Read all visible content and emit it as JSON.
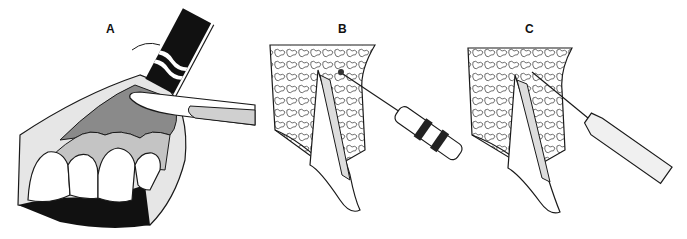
{
  "figure": {
    "panels": [
      {
        "id": "A",
        "label": "A",
        "description": "Anterior teeth with gingiva, local anesthetic injection with syringe needle cap and instrument at mucobuccal fold"
      },
      {
        "id": "B",
        "label": "B",
        "description": "Cross-section of tooth in cancellous bone, needle with syringe inserted into bone near apex"
      },
      {
        "id": "C",
        "label": "C",
        "description": "Cross-section of tooth in cancellous bone, fine needle with plain syringe barrel inserted into periodontal region"
      }
    ],
    "colors": {
      "ink": "#1a1a1a",
      "gingiva_dark": "#8a8a8a",
      "gingiva_light": "#c4c4c4",
      "lip": "#e6e6e6",
      "background": "#ffffff"
    }
  }
}
